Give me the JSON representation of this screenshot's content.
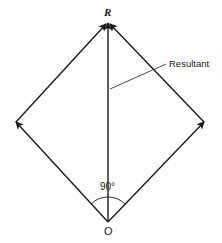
{
  "diagram": {
    "title": "",
    "labels": {
      "resultant_point": "R",
      "resultant": "Resultant",
      "angle": "90°",
      "origin": "O"
    },
    "vectors": [
      {
        "name": "left-component",
        "from": "O",
        "to": "left-vertex"
      },
      {
        "name": "right-component",
        "from": "O",
        "to": "right-vertex"
      },
      {
        "name": "left-translated",
        "from": "left-vertex",
        "to": "R"
      },
      {
        "name": "right-translated",
        "from": "right-vertex",
        "to": "R"
      },
      {
        "name": "resultant",
        "from": "O",
        "to": "R"
      }
    ],
    "colors": {
      "line": "#1a1a1a",
      "background": "#ffffff"
    }
  }
}
